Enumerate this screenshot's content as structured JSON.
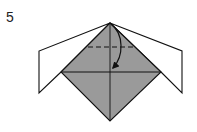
{
  "diagram": {
    "type": "origami-step",
    "step_number": "5",
    "colors": {
      "paper_back": "#ffffff",
      "paper_front": "#9a9a9a",
      "line": "#111111"
    },
    "elements": [
      "left white flap",
      "right white flap",
      "gray diamond (square base)",
      "vertical center crease",
      "horizontal center crease",
      "dashed valley-fold line near top",
      "curved arrow: fold top point down to center"
    ]
  }
}
